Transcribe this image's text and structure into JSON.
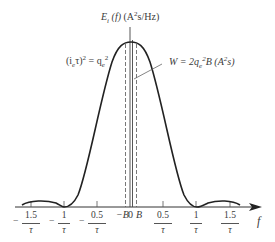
{
  "diagram": {
    "type": "spectral_density_plot",
    "y_label": {
      "main": "E",
      "sub": "i",
      "arg": "(f)",
      "units_pre": "(A",
      "units_sup": "2",
      "units_post": "s/Hz)"
    },
    "left_annotation": {
      "lhs": "(i",
      "lhs_sub": "e",
      "lhs_mid": "τ)",
      "lhs_sup": "2",
      "eq": " = q",
      "rhs_sub": "e",
      "rhs_sup": "2"
    },
    "right_annotation": {
      "text_pre": "W = 2q",
      "sub": "e",
      "sup": "2",
      "text_mid": "B (A",
      "unit_sup": "2",
      "text_post": "s)"
    },
    "x_axis_label": "f",
    "center_labels": {
      "minus_b": "−B",
      "zero": "0",
      "plus_b": "B"
    },
    "ticks": [
      {
        "sign": "−",
        "num": "1.5",
        "den": "τ",
        "value": -1.5
      },
      {
        "sign": "−",
        "num": "1",
        "den": "τ",
        "value": -1.0
      },
      {
        "sign": "−",
        "num": "0.5",
        "den": "τ",
        "value": -0.5
      },
      {
        "sign": "",
        "num": "0.5",
        "den": "τ",
        "value": 0.5
      },
      {
        "sign": "",
        "num": "1",
        "den": "τ",
        "value": 1.0
      },
      {
        "sign": "",
        "num": "1.5",
        "den": "τ",
        "value": 1.5
      }
    ],
    "curve": "sinc^2 shaped spectrum with main lobe between -1/τ and 1/τ, side lobes beyond",
    "colors": {
      "line": "#222222",
      "text": "#3a3a3a",
      "leader": "#666666"
    }
  }
}
